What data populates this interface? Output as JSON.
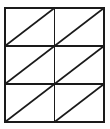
{
  "figure": {
    "type": "geometric-diagram",
    "background_color": "#fefefe",
    "line_color": "#1a1a1a",
    "fill_color": "#ffffff"
  },
  "chart_data": {
    "type": "diagram",
    "columns": 2,
    "rows": 3,
    "cell_count": 6,
    "triangle_count": 12,
    "diagonal_direction": "bottom-left to top-right",
    "bounds": {
      "x": 5,
      "y": 8,
      "width": 99,
      "height": 114
    },
    "cell_width": 49.5,
    "cell_height": 38,
    "outer_border_width": 2,
    "inner_line_width": 1.6,
    "diagonal_line_width": 1.6,
    "vertical_dividers": [
      54.5
    ],
    "horizontal_dividers": [
      46,
      84
    ],
    "cells": [
      {
        "id": "cell-r1c1",
        "row": 1,
        "col": 1,
        "x": 5,
        "y": 8,
        "w": 49.5,
        "h": 38,
        "diagonal": "bottom-left-to-top-right"
      },
      {
        "id": "cell-r1c2",
        "row": 1,
        "col": 2,
        "x": 54.5,
        "y": 8,
        "w": 49.5,
        "h": 38,
        "diagonal": "bottom-left-to-top-right"
      },
      {
        "id": "cell-r2c1",
        "row": 2,
        "col": 1,
        "x": 5,
        "y": 46,
        "w": 49.5,
        "h": 38,
        "diagonal": "bottom-left-to-top-right"
      },
      {
        "id": "cell-r2c2",
        "row": 2,
        "col": 2,
        "x": 54.5,
        "y": 46,
        "w": 49.5,
        "h": 38,
        "diagonal": "bottom-left-to-top-right"
      },
      {
        "id": "cell-r3c1",
        "row": 3,
        "col": 1,
        "x": 5,
        "y": 84,
        "w": 49.5,
        "h": 38,
        "diagonal": "bottom-left-to-top-right"
      },
      {
        "id": "cell-r3c2",
        "row": 3,
        "col": 2,
        "x": 54.5,
        "y": 84,
        "w": 49.5,
        "h": 38,
        "diagonal": "bottom-left-to-top-right"
      }
    ]
  }
}
